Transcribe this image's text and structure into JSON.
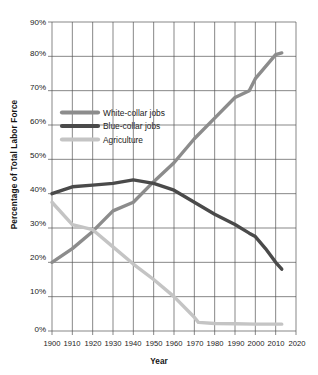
{
  "chart_data": {
    "type": "line",
    "title": "",
    "xlabel": "Year",
    "ylabel": "Percentage of Total Labor Force",
    "xlim": [
      1900,
      2020
    ],
    "ylim": [
      0,
      90
    ],
    "grid": true,
    "legend_position": "upper-left-inside",
    "x_ticks": [
      "1900",
      "1910",
      "1920",
      "1930",
      "1940",
      "1950",
      "1960",
      "1970",
      "1980",
      "1990",
      "2000",
      "2010",
      "2020"
    ],
    "y_ticks": [
      "0%",
      "10%",
      "20%",
      "30%",
      "40%",
      "50%",
      "60%",
      "70%",
      "80%",
      "90%"
    ],
    "series": [
      {
        "name": "White-collar jobs",
        "color": "#8c8c8c",
        "x": [
          1900,
          1910,
          1920,
          1930,
          1940,
          1950,
          1960,
          1970,
          1980,
          1990,
          1997,
          2000,
          2005,
          2010,
          2013
        ],
        "values": [
          20,
          24,
          29,
          35,
          37.5,
          43.5,
          49,
          56,
          62,
          68,
          70,
          73.5,
          77,
          80.5,
          81
        ]
      },
      {
        "name": "Blue-collar jobs",
        "color": "#4a4a4a",
        "x": [
          1900,
          1910,
          1920,
          1930,
          1940,
          1950,
          1960,
          1970,
          1980,
          1990,
          1997,
          2000,
          2005,
          2010,
          2013
        ],
        "values": [
          40,
          42,
          42.5,
          43,
          44,
          43,
          41,
          37.5,
          34,
          31,
          28.5,
          27.5,
          24,
          20,
          18
        ]
      },
      {
        "name": "Agriculture",
        "color": "#c4c4c4",
        "x": [
          1900,
          1910,
          1920,
          1930,
          1940,
          1950,
          1960,
          1970,
          1972,
          1980,
          1990,
          2000,
          2010,
          2013
        ],
        "values": [
          37.5,
          31,
          29.5,
          24.5,
          19.5,
          15,
          10,
          4,
          2.5,
          2.2,
          2.1,
          2,
          2,
          2
        ]
      }
    ],
    "legend": [
      {
        "label": "White-collar jobs",
        "color": "#8c8c8c"
      },
      {
        "label": "Blue-collar jobs",
        "color": "#4a4a4a"
      },
      {
        "label": "Agriculture",
        "color": "#c4c4c4"
      }
    ]
  }
}
